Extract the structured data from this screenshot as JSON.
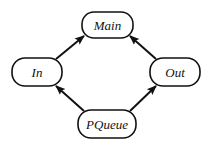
{
  "diagram": {
    "type": "directed-graph",
    "nodes": [
      {
        "id": "main",
        "label": "Main",
        "x": 82,
        "y": 12,
        "w": 51,
        "h": 26
      },
      {
        "id": "in",
        "label": "In",
        "x": 12,
        "y": 58,
        "w": 50,
        "h": 28
      },
      {
        "id": "out",
        "label": "Out",
        "x": 150,
        "y": 58,
        "w": 50,
        "h": 28
      },
      {
        "id": "pqueue",
        "label": "PQueue",
        "x": 78,
        "y": 110,
        "w": 58,
        "h": 28
      }
    ],
    "edges": [
      {
        "from": "In",
        "to": "Main"
      },
      {
        "from": "Out",
        "to": "Main"
      },
      {
        "from": "PQueue",
        "to": "In"
      },
      {
        "from": "PQueue",
        "to": "Out"
      }
    ],
    "colors": {
      "stroke": "#111111",
      "fill": "#ffffff",
      "background": "#ffffff"
    }
  }
}
